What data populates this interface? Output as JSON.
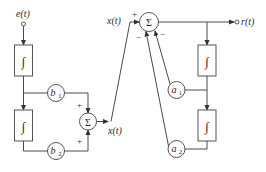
{
  "diagram": {
    "type": "block-diagram",
    "signals": {
      "input": "e(t)",
      "intermediate_left": "x(t)",
      "intermediate_top": "x(t)",
      "output": "r(t)"
    },
    "blocks": {
      "integrator_symbol": "∫",
      "sum_symbol": "Σ"
    },
    "gains": {
      "b1": "b",
      "b1_sub": "1",
      "b2": "b",
      "b2_sub": "2",
      "a1": "a",
      "a1_sub": "1",
      "a2": "a",
      "a2_sub": "2"
    },
    "signs": {
      "left_sum_top": "+",
      "left_sum_bottom": "+",
      "right_sum_left": "+",
      "right_sum_bottom_left": "−",
      "right_sum_bottom_right": "−"
    },
    "colors": {
      "line": "#4a4a4a",
      "text": "#2a2a2a",
      "background": "#ffffff"
    }
  }
}
